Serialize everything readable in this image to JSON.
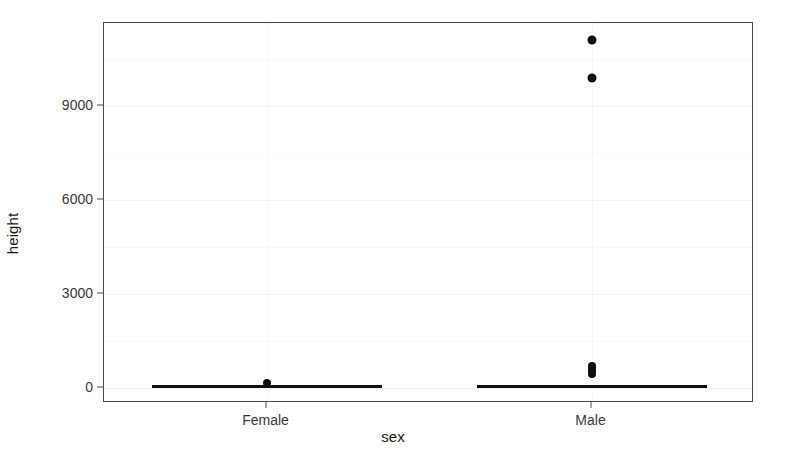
{
  "chart_data": {
    "type": "box",
    "title": "",
    "subtitle": "",
    "xlabel": "sex",
    "ylabel": "height",
    "categories": [
      "Female",
      "Male"
    ],
    "ytick_labels": [
      "0",
      "3000",
      "6000",
      "9000"
    ],
    "ytick_values": [
      0,
      3000,
      6000,
      9000
    ],
    "ylim": [
      -480,
      11650
    ],
    "grid": true,
    "grid_major_y": [
      0,
      3000,
      6000,
      9000
    ],
    "grid_minor_y": [
      1500,
      4500,
      7500,
      10500
    ],
    "legend": "none",
    "annotations": [],
    "series": [
      {
        "name": "Female",
        "category": "Female",
        "min": 0,
        "q1": 63,
        "median": 65,
        "q3": 68,
        "max": 72,
        "whisker_low": 55,
        "whisker_high": 75,
        "outliers": [
          160
        ]
      },
      {
        "name": "Male",
        "category": "Male",
        "min": 0,
        "q1": 68,
        "median": 70,
        "q3": 73,
        "max": 78,
        "whisker_low": 60,
        "whisker_high": 80,
        "outliers": [
          430,
          530,
          620,
          710,
          9900,
          11100
        ]
      }
    ]
  },
  "figure": {
    "background_color": "#ffffff",
    "panel_border_color": "#4a4a4a",
    "point_color": "#0d0d0d",
    "grid_color": "#f2f2f2",
    "axis_text_color": "#3a3a3a",
    "axis_title_color": "#1a1a1a"
  }
}
